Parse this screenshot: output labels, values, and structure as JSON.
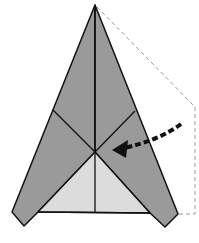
{
  "figure": {
    "title": "Paper airplane fold step"
  },
  "colors": {
    "dark_paper": "#9a9a9a",
    "light_paper": "#dcdcdc",
    "crease": "#111111",
    "dashed_outline": "#9a9a9a",
    "arrow": "#111111",
    "background": "#ffffff"
  }
}
